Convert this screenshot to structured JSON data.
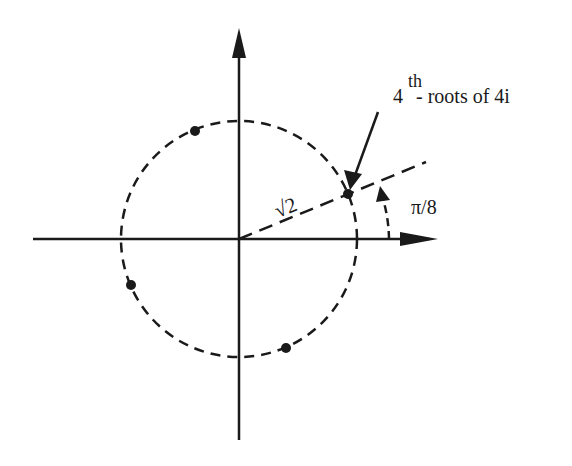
{
  "diagram": {
    "annotation": {
      "base": "4",
      "superscript": "th",
      "rest": "- roots of 4i"
    },
    "radius_label": "√2",
    "angle_label": "π/8",
    "circle": {
      "radius": "√2",
      "style": "dashed"
    },
    "roots": [
      {
        "angle": "π/8"
      },
      {
        "angle": "5π/8"
      },
      {
        "angle": "9π/8"
      },
      {
        "angle": "13π/8"
      }
    ],
    "colors": {
      "ink": "#1a1a1a",
      "background": "#ffffff"
    }
  }
}
